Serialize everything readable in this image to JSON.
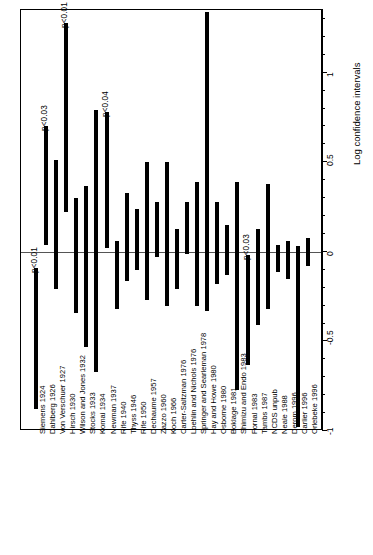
{
  "chart": {
    "title": "Zygosity by Handedness",
    "axis_title": "Log confidence intervals"
  },
  "chart_data": {
    "type": "bar",
    "title": "Zygosity by Handedness",
    "xlabel": "",
    "ylabel": "Log confidence intervals",
    "ylim": [
      -1,
      1.35
    ],
    "grid": false,
    "legend": "none",
    "orientation": "vertical-intervals",
    "tick_values": [
      -1,
      -0.5,
      0,
      0.5,
      1
    ],
    "tick_labels": [
      "-1",
      "-0.5",
      "0",
      "0.5",
      "1"
    ],
    "minor_tick_step": 0.1,
    "reference_line": 0,
    "categories": [
      "Siemens 1924",
      "Dahlberg 1926",
      "Von Verschuer 1927",
      "Hirsch 1930",
      "Wilson and Jones 1932",
      "Stocks 1933",
      "Komai 1934",
      "Newman 1937",
      "Rife 1940",
      "Thyss 1946",
      "Rife 1950",
      "Dechaume 1957",
      "Zazzo 1960",
      "Koch 1966",
      "Carter-Saltzman 1976",
      "Loehlin and Nichols 1976",
      "Springer and Searleman 1978",
      "Hay and Howe 1980",
      "Osborne 1980",
      "Boklage 1981",
      "Shimizu and Endo 1983",
      "Fornal 1983",
      "Tambs 1987",
      "NCDS unpub",
      "Neale 1988",
      "Derom 1996",
      "Carlier 1996",
      "Orlebeke 1996"
    ],
    "intervals": [
      {
        "study": "Siemens 1924",
        "lower": -0.88,
        "upper": -0.09,
        "p_label": "p<0.01"
      },
      {
        "study": "Dahlberg 1926",
        "lower": 0.04,
        "upper": 0.7,
        "p_label": "p<0.03"
      },
      {
        "study": "Von Verschuer 1927",
        "lower": -0.21,
        "upper": 0.51,
        "p_label": ""
      },
      {
        "study": "Hirsch 1930",
        "lower": 0.22,
        "upper": 1.28,
        "p_label": "p<0.01"
      },
      {
        "study": "Wilson and Jones 1932",
        "lower": -0.34,
        "upper": 0.3,
        "p_label": ""
      },
      {
        "study": "Stocks 1933",
        "lower": -0.53,
        "upper": 0.37,
        "p_label": ""
      },
      {
        "study": "Komai 1934",
        "lower": -0.67,
        "upper": 0.79,
        "p_label": ""
      },
      {
        "study": "Newman 1937",
        "lower": 0.02,
        "upper": 0.78,
        "p_label": "p<0.04"
      },
      {
        "study": "Rife 1940",
        "lower": -0.32,
        "upper": 0.06,
        "p_label": ""
      },
      {
        "study": "Thyss 1946",
        "lower": -0.16,
        "upper": 0.33,
        "p_label": ""
      },
      {
        "study": "Rife 1950",
        "lower": -0.1,
        "upper": 0.24,
        "p_label": ""
      },
      {
        "study": "Dechaume 1957",
        "lower": -0.27,
        "upper": 0.5,
        "p_label": ""
      },
      {
        "study": "Zazzo 1960",
        "lower": -0.03,
        "upper": 0.28,
        "p_label": ""
      },
      {
        "study": "Koch 1966",
        "lower": -0.3,
        "upper": 0.5,
        "p_label": ""
      },
      {
        "study": "Carter-Saltzman 1976",
        "lower": -0.21,
        "upper": 0.13,
        "p_label": ""
      },
      {
        "study": "Loehlin and Nichols 1976",
        "lower": -0.01,
        "upper": 0.28,
        "p_label": ""
      },
      {
        "study": "Springer and Searleman 1978",
        "lower": -0.3,
        "upper": 0.39,
        "p_label": ""
      },
      {
        "study": "Hay and Howe 1980",
        "lower": -0.33,
        "upper": 1.34,
        "p_label": ""
      },
      {
        "study": "Osborne 1980",
        "lower": -0.18,
        "upper": 0.28,
        "p_label": ""
      },
      {
        "study": "Boklage 1981",
        "lower": -0.13,
        "upper": 0.15,
        "p_label": ""
      },
      {
        "study": "Shimizu and Endo 1983",
        "lower": -0.77,
        "upper": 0.39,
        "p_label": ""
      },
      {
        "study": "Fornal 1983",
        "lower": -0.63,
        "upper": -0.02,
        "p_label": "p<0.03"
      },
      {
        "study": "Tambs 1987",
        "lower": -0.41,
        "upper": 0.13,
        "p_label": ""
      },
      {
        "study": "NCDS unpub",
        "lower": -0.32,
        "upper": 0.38,
        "p_label": ""
      },
      {
        "study": "Neale 1988",
        "lower": -0.11,
        "upper": 0.04,
        "p_label": ""
      },
      {
        "study": "Derom 1996",
        "lower": -0.15,
        "upper": 0.06,
        "p_label": ""
      },
      {
        "study": "Carlier 1996",
        "lower": -0.98,
        "upper": 0.03,
        "p_label": ""
      },
      {
        "study": "Orlebeke 1996",
        "lower": -0.08,
        "upper": 0.08,
        "p_label": ""
      }
    ]
  }
}
